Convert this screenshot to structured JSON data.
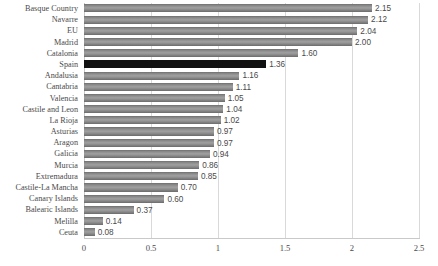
{
  "chart_data": {
    "type": "bar",
    "orientation": "horizontal",
    "title": "",
    "subtitle": "",
    "xlabel": "",
    "ylabel": "",
    "xlim": [
      0,
      2.5
    ],
    "xticks": [
      "0",
      "0.5",
      "1",
      "1.5",
      "2",
      "2.5"
    ],
    "xtick_values": [
      0,
      0.5,
      1,
      1.5,
      2,
      2.5
    ],
    "grid": true,
    "grid_axis": "x",
    "legend": false,
    "legend_position": "none",
    "value_labels": true,
    "value_label_format": "0.00",
    "bar_color": "#8c8c8c",
    "highlight_color": "#111111",
    "highlight_category": "Spain",
    "categories": [
      "Basque Country",
      "Navarre",
      "EU",
      "Madrid",
      "Catalonia",
      "Spain",
      "Andalusia",
      "Cantabria",
      "Valencia",
      "Castile and Leon",
      "La Rioja",
      "Asturias",
      "Aragon",
      "Galicia",
      "Murcia",
      "Extremadura",
      "Castile-La Mancha",
      "Canary Islands",
      "Balearic Islands",
      "Melilla",
      "Ceuta"
    ],
    "values": [
      2.15,
      2.12,
      2.04,
      2.0,
      1.6,
      1.36,
      1.16,
      1.11,
      1.05,
      1.04,
      1.02,
      0.97,
      0.97,
      0.94,
      0.86,
      0.85,
      0.7,
      0.6,
      0.37,
      0.14,
      0.08
    ],
    "labels": [
      "2.15",
      "2.12",
      "2.04",
      "2.00",
      "1.60",
      "1.36",
      "1.16",
      "1.11",
      "1.05",
      "1.04",
      "1.02",
      "0.97",
      "0.97",
      "0.94",
      "0.86",
      "0.85",
      "0.70",
      "0.60",
      "0.37",
      "0.14",
      "0.08"
    ]
  }
}
